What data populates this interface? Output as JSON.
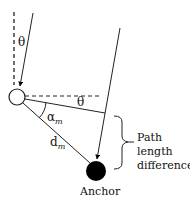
{
  "diagram": {
    "labels": {
      "theta_top": "θ",
      "theta_mid": "θ",
      "alpha": "α",
      "alpha_sub": "m",
      "distance": "d",
      "distance_sub": "m",
      "anchor": "Anchor",
      "brace_line1": "Path",
      "brace_line2": "length",
      "brace_line3": "difference"
    },
    "colors": {
      "stroke": "#222222",
      "anchor_fill": "#000000",
      "node_fill": "#ffffff"
    }
  }
}
